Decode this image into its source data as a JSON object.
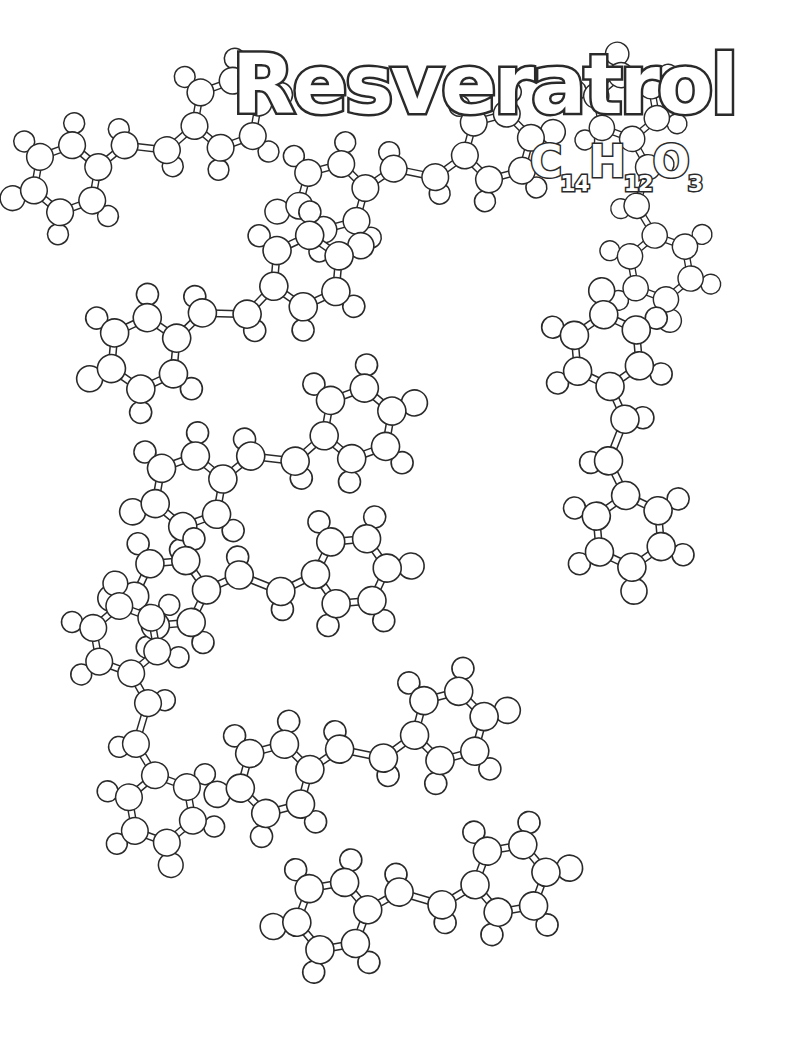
{
  "page": {
    "title": "Resveratrol",
    "formula": {
      "elements": [
        {
          "symbol": "C",
          "count": "14"
        },
        {
          "symbol": "H",
          "count": "12"
        },
        {
          "symbol": "O",
          "count": "3"
        }
      ]
    },
    "style": {
      "line_color": "#2a2a2a",
      "fill_color": "#ffffff"
    }
  },
  "molecules": [
    {
      "x": 200,
      "y": 130,
      "rot": -20,
      "scale": 0.95
    },
    {
      "x": 470,
      "y": 160,
      "rot": -15,
      "scale": 0.95
    },
    {
      "x": 280,
      "y": 290,
      "rot": -25,
      "scale": 1.0
    },
    {
      "x": 650,
      "y": 240,
      "rot": 80,
      "scale": 0.9
    },
    {
      "x": 330,
      "y": 440,
      "rot": -20,
      "scale": 1.0
    },
    {
      "x": 620,
      "y": 500,
      "rot": 85,
      "scale": 1.0
    },
    {
      "x": 320,
      "y": 580,
      "rot": -5,
      "scale": 1.0
    },
    {
      "x": 150,
      "y": 780,
      "rot": 80,
      "scale": 0.95
    },
    {
      "x": 420,
      "y": 740,
      "rot": -15,
      "scale": 1.0
    },
    {
      "x": 480,
      "y": 890,
      "rot": -10,
      "scale": 1.0
    }
  ]
}
